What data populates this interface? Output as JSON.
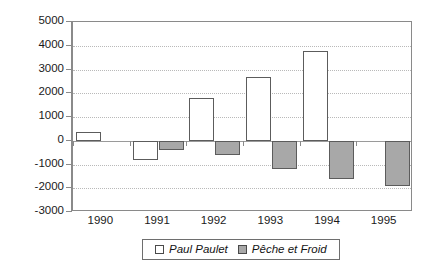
{
  "chart_data": {
    "type": "bar",
    "title": "",
    "subtitle": "",
    "xlabel": "",
    "ylabel": "",
    "categories": [
      "1990",
      "1991",
      "1992",
      "1993",
      "1994",
      "1995"
    ],
    "series": [
      {
        "name": "Paul Paulet",
        "color": "#ffffff",
        "values": [
          350,
          -800,
          1780,
          2680,
          3780,
          0
        ]
      },
      {
        "name": "Pêche et Froid",
        "color": "#a8a8a8",
        "values": [
          0,
          -400,
          -600,
          -1180,
          -1620,
          -1900
        ]
      }
    ],
    "ylim": [
      -3000,
      5000
    ],
    "ytick_values": [
      5000,
      4000,
      3000,
      2000,
      1000,
      0,
      -1000,
      -2000,
      -3000
    ],
    "ytick_labels": [
      "5000",
      "4000",
      "3000",
      "2000",
      "1000",
      "0",
      "-1000",
      "-2000",
      "-3000"
    ],
    "grid": true,
    "grid_style": "dotted-horizontal",
    "legend_position": "bottom-center"
  },
  "legend": {
    "entries": [
      {
        "label": "Paul Paulet",
        "swatch": "white-square-outline"
      },
      {
        "label": "Pêche et Froid",
        "swatch": "gray-filled-square"
      }
    ]
  }
}
